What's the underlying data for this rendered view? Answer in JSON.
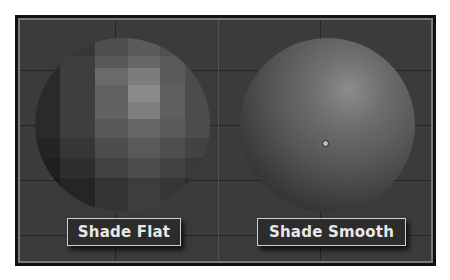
{
  "viewport": {
    "background_color": "#3b3b3b",
    "frame_color": "#111111",
    "frame_inner_border_color": "#7a7a7a"
  },
  "panels": [
    {
      "name": "flat",
      "label": "Shade Flat",
      "sphere_shading": "flat"
    },
    {
      "name": "smooth",
      "label": "Shade Smooth",
      "sphere_shading": "smooth",
      "pivot_icon": "origin-dot-icon"
    }
  ]
}
